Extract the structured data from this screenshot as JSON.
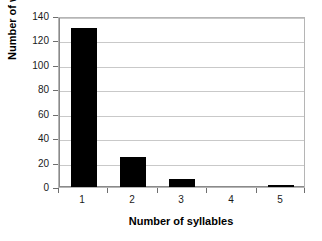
{
  "chart_data": {
    "type": "bar",
    "title": "",
    "subtitle": "",
    "xlabel": "Number of syllables",
    "ylabel": "Number of words",
    "categories": [
      "1",
      "2",
      "3",
      "4",
      "5"
    ],
    "values": [
      131,
      25,
      7,
      0,
      1
    ],
    "series": [
      {
        "name": "Number of words",
        "values": [
          131,
          25,
          7,
          0,
          1
        ]
      }
    ],
    "ylim": [
      0,
      140
    ],
    "yticks": [
      0,
      20,
      40,
      60,
      80,
      100,
      120,
      140
    ],
    "ytick_labels": [
      "0",
      "20",
      "40",
      "60",
      "80",
      "100",
      "120",
      "140"
    ],
    "xtick_labels": [
      "1",
      "2",
      "3",
      "4",
      "5"
    ],
    "grid": "horizontal",
    "legend": "none",
    "bar_color": "#000000",
    "gridline_color": "#c9c9c9",
    "axis_color": "#8a8a8a",
    "background_color": "#ffffff",
    "annotations": []
  }
}
